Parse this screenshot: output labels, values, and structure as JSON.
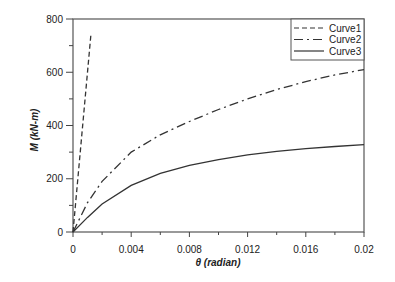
{
  "chart_data": {
    "type": "line",
    "title": "",
    "xlabel": "θ (radian)",
    "ylabel": "M (kN-m)",
    "xlim": [
      0,
      0.02
    ],
    "ylim": [
      0,
      800
    ],
    "x_ticks": [
      "0",
      "0.004",
      "0.008",
      "0.012",
      "0.016",
      "0.02"
    ],
    "y_ticks": [
      "0",
      "200",
      "400",
      "600",
      "800"
    ],
    "grid": false,
    "legend_position": "top-right",
    "series": [
      {
        "name": "Curve1",
        "style": "dashed",
        "x": [
          0,
          0.00124
        ],
        "y": [
          0,
          745
        ]
      },
      {
        "name": "Curve2",
        "style": "dash-dot",
        "x": [
          0,
          0.001,
          0.002,
          0.004,
          0.006,
          0.008,
          0.01,
          0.012,
          0.014,
          0.016,
          0.018,
          0.02
        ],
        "y": [
          0,
          110,
          190,
          300,
          365,
          415,
          460,
          500,
          535,
          565,
          590,
          610
        ]
      },
      {
        "name": "Curve3",
        "style": "solid",
        "x": [
          0,
          0.001,
          0.002,
          0.004,
          0.006,
          0.008,
          0.01,
          0.012,
          0.014,
          0.016,
          0.018,
          0.02
        ],
        "y": [
          0,
          55,
          105,
          175,
          220,
          250,
          272,
          290,
          303,
          313,
          321,
          328
        ]
      }
    ]
  }
}
